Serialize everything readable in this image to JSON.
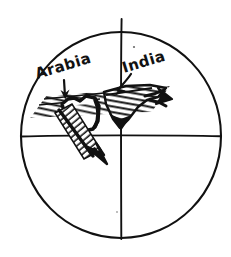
{
  "figure": {
    "background_color": "#ffffff",
    "ink_color": "#111111",
    "globe": {
      "name": "globe-circle",
      "center_x": 121,
      "center_y": 136,
      "radius_x": 100,
      "radius_y": 104,
      "equator_label": "",
      "meridian_label": ""
    },
    "labels": [
      {
        "id": "arabia",
        "text": "Arabia",
        "x": 37,
        "y": 79,
        "rotation": -17,
        "font_size": 15
      },
      {
        "id": "india",
        "text": "India",
        "x": 124,
        "y": 73,
        "rotation": -17,
        "font_size": 15
      }
    ],
    "pointers": [
      {
        "id": "arabia-pointer",
        "from_label": "Arabia",
        "direction": "down"
      },
      {
        "id": "india-pointer",
        "from_label": "India",
        "direction": "down-left"
      }
    ],
    "motion_arrows": [
      {
        "id": "arabia-motion-arrow",
        "direction": "down-right",
        "describes": "Arabia plate motion"
      },
      {
        "id": "india-motion-arrow",
        "direction": "right",
        "describes": "India plate motion"
      }
    ],
    "landmasses": [
      {
        "id": "arabia-landmass",
        "label": "Arabia",
        "fill": "hatched"
      },
      {
        "id": "india-landmass",
        "label": "India",
        "fill": "hatched"
      }
    ]
  }
}
